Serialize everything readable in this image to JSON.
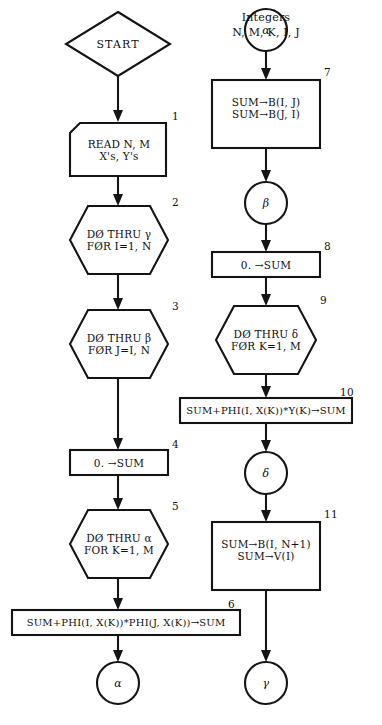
{
  "diagram": {
    "title_note": {
      "line1": "Integers",
      "line2": "N, M, K, I, J"
    },
    "terminals": {
      "start": "START"
    },
    "connectors": {
      "alpha": "α",
      "beta": "β",
      "gamma": "γ",
      "delta": "δ"
    },
    "nodes": [
      {
        "id": "start",
        "number": "",
        "shape": "diamond",
        "lines": [
          "START"
        ]
      },
      {
        "id": "read",
        "number": "1",
        "shape": "io-parallelogram",
        "lines": [
          "READ N, M",
          "X's, Y's"
        ]
      },
      {
        "id": "loop-i",
        "number": "2",
        "shape": "hexagon",
        "lines": [
          "DØ THRU γ",
          "FØR I=1, N"
        ]
      },
      {
        "id": "loop-j",
        "number": "3",
        "shape": "hexagon",
        "lines": [
          "DØ THRU β",
          "FØR J=I, N"
        ]
      },
      {
        "id": "zero-sum-1",
        "number": "4",
        "shape": "rect",
        "lines": [
          "0. →SUM"
        ]
      },
      {
        "id": "loop-k-1",
        "number": "5",
        "shape": "hexagon",
        "lines": [
          "DØ THRU α",
          "FOR K=1, M"
        ]
      },
      {
        "id": "accum-phi-phi",
        "number": "6",
        "shape": "rect-wide",
        "lines": [
          "SUM+PHI(I, X(K))*PHI(J, X(K))→SUM"
        ]
      },
      {
        "id": "store-b-sym",
        "number": "7",
        "shape": "rect-tall",
        "lines": [
          "SUM→B(I, J)",
          "SUM→B(J, I)"
        ]
      },
      {
        "id": "zero-sum-2",
        "number": "8",
        "shape": "rect",
        "lines": [
          "0. →SUM"
        ]
      },
      {
        "id": "loop-k-2",
        "number": "9",
        "shape": "hexagon",
        "lines": [
          "DØ THRU δ",
          "FØR K=1, M"
        ]
      },
      {
        "id": "accum-phi-y",
        "number": "10",
        "shape": "rect-wide",
        "lines": [
          "SUM+PHI(I, X(K))*Y(K)→SUM"
        ]
      },
      {
        "id": "store-b-v",
        "number": "11",
        "shape": "rect-tall",
        "lines": [
          "SUM→B(I, N+1)",
          "SUM→V(I)"
        ]
      }
    ]
  }
}
